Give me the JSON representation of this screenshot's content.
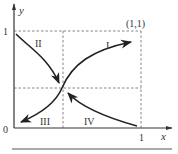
{
  "diagram": {
    "axes": {
      "x_label": "x",
      "y_label": "y",
      "origin_label": "0",
      "x_tick_label": "1",
      "y_tick_label": "1"
    },
    "corner_point_label": "(1,1)",
    "regions": [
      {
        "id": "I",
        "label": "I",
        "direction": "from center toward (1,1)"
      },
      {
        "id": "II",
        "label": "II",
        "direction": "from (0,1) toward center"
      },
      {
        "id": "III",
        "label": "III",
        "direction": "from center toward (0,0)"
      },
      {
        "id": "IV",
        "label": "IV",
        "direction": "from (1,0) toward center"
      }
    ],
    "colors": {
      "curve": "#222222",
      "axis": "#333333",
      "dashed": "#666666"
    }
  }
}
